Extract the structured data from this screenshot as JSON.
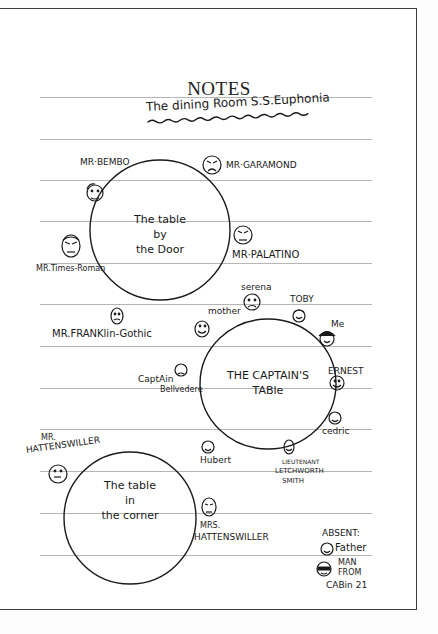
{
  "page": {
    "title": "NOTES",
    "subtitle": "The dining Room S.S.Euphonia"
  },
  "tables": [
    {
      "name": "The table by the Door",
      "lines": [
        "The table",
        "by",
        "the Door"
      ],
      "guests": [
        {
          "name": "MR·BEMBO",
          "mood": "neutral"
        },
        {
          "name": "MR·GARAMOND",
          "mood": "angry"
        },
        {
          "name": "MR·PALATINO",
          "mood": "angry"
        },
        {
          "name": "MR.Times-Roman",
          "mood": "angry"
        },
        {
          "name": "MR.FRANKlin-Gothic",
          "mood": "neutral"
        }
      ]
    },
    {
      "name": "THE CAPTAIN'S TABLE",
      "lines": [
        "THE CAPTAIN'S",
        "TABle"
      ],
      "guests": [
        {
          "name": "serena",
          "mood": "sad"
        },
        {
          "name": "TOBY",
          "mood": "happy"
        },
        {
          "name": "Me",
          "mood": "happy"
        },
        {
          "name": "mother",
          "mood": "happy"
        },
        {
          "name": "ERNEST",
          "mood": "happy"
        },
        {
          "name": "cedric",
          "mood": "happy"
        },
        {
          "name": "Captain Bellvedere",
          "mood": "sad"
        },
        {
          "name": "Hubert",
          "mood": "happy"
        },
        {
          "name": "LIEUTENANT LETCHWORTH SMITH",
          "mood": "happy"
        }
      ]
    },
    {
      "name": "The table in the corner",
      "lines": [
        "The table",
        "in",
        "the corner"
      ],
      "guests": [
        {
          "name": "MR. HATTENSWILLER",
          "mood": "neutral"
        },
        {
          "name": "MRS. HATTENSWILLER",
          "mood": "sad"
        }
      ]
    }
  ],
  "labels": {
    "bembo": "MR·BEMBO",
    "garamond": "MR·GARAMOND",
    "palatino": "MR·PALATINO",
    "times": "MR.Times-Roman",
    "franklin": "MR.FRANKlin-Gothic",
    "serena": "serena",
    "toby": "TOBY",
    "me": "Me",
    "mother": "mother",
    "ernest": "ERNEST",
    "cedric": "cedric",
    "captain1": "CaptAin",
    "captain2": "Bellvedere",
    "hubert": "Hubert",
    "lt1": "LIEUTENANT",
    "lt2": "LETCHWORTH",
    "lt3": "SMITH",
    "hatt_mr1": "MR.",
    "hatt_mr2": "HATTENSWILLER",
    "hatt_mrs1": "MRS.",
    "hatt_mrs2": "HATTENSWILLER"
  },
  "absent": {
    "heading": "ABSENT:",
    "items": [
      {
        "name": "Father",
        "mood": "happy"
      },
      {
        "name": "MAN FROM CABIN 21",
        "lines": [
          "MAN",
          "FROM",
          "CABin 21"
        ],
        "mood": "sunglasses"
      }
    ]
  },
  "colors": {
    "ink": "#1a1a1a",
    "rule": "#b5b5b5",
    "border": "#3a3a3a"
  }
}
